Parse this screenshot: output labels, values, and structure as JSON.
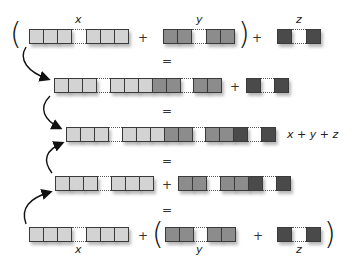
{
  "colors": {
    "x_cell": "#d3d3d3",
    "y_cell": "#8c8c8c",
    "z_cell": "#4a4a4a",
    "border": "#3a3a3a"
  },
  "labels": {
    "x": "x",
    "y": "y",
    "z": "z",
    "plus": "+",
    "equals": "=",
    "open_paren": "(",
    "close_paren": ")",
    "result": "x + y + z"
  },
  "rows": [
    {
      "name": "row1",
      "expression": "(x + y) + z"
    },
    {
      "name": "row2",
      "expression": "(x ++ y) + z"
    },
    {
      "name": "row3",
      "expression": "x + y + z"
    },
    {
      "name": "row4",
      "expression": "x + (y ++ z)"
    },
    {
      "name": "row5",
      "expression": "x + (y + z)"
    }
  ]
}
